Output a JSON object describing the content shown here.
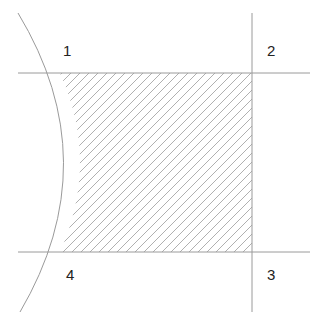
{
  "diagram": {
    "labels": [
      "1",
      "2",
      "3",
      "4"
    ],
    "colors": {
      "line": "#9a9a9a",
      "hatch": "#b0b0b0",
      "text": "#222222",
      "background": "#ffffff"
    }
  }
}
